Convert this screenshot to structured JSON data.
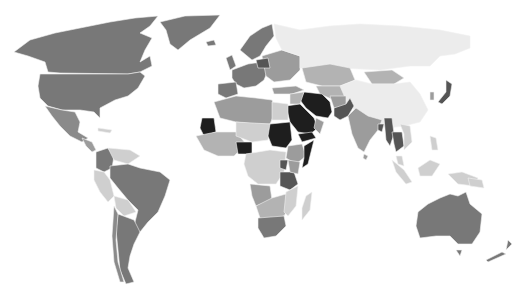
{
  "map": {
    "type": "choropleth",
    "projection": "world",
    "color_scale": {
      "lightest": "#ececec",
      "light": "#cfcfcf",
      "medium_light": "#b3b3b3",
      "medium": "#9c9c9c",
      "dark": "#787878",
      "darker": "#555555",
      "darkest": "#1e1e1e"
    },
    "regions": [
      {
        "name": "Canada",
        "shade": "dark"
      },
      {
        "name": "United States",
        "shade": "dark"
      },
      {
        "name": "Greenland",
        "shade": "dark"
      },
      {
        "name": "Mexico",
        "shade": "dark"
      },
      {
        "name": "Central America",
        "shade": "medium"
      },
      {
        "name": "Colombia",
        "shade": "dark"
      },
      {
        "name": "Venezuela",
        "shade": "light"
      },
      {
        "name": "Peru",
        "shade": "light"
      },
      {
        "name": "Brazil",
        "shade": "dark"
      },
      {
        "name": "Bolivia",
        "shade": "light"
      },
      {
        "name": "Argentina",
        "shade": "dark"
      },
      {
        "name": "Chile",
        "shade": "dark"
      },
      {
        "name": "Western Europe",
        "shade": "dark"
      },
      {
        "name": "Scandinavia",
        "shade": "dark"
      },
      {
        "name": "Eastern Europe",
        "shade": "medium"
      },
      {
        "name": "Russia",
        "shade": "lightest"
      },
      {
        "name": "Kazakhstan",
        "shade": "medium_light"
      },
      {
        "name": "Mongolia",
        "shade": "medium_light"
      },
      {
        "name": "China",
        "shade": "lightest"
      },
      {
        "name": "Japan",
        "shade": "darker"
      },
      {
        "name": "India",
        "shade": "medium"
      },
      {
        "name": "Pakistan",
        "shade": "darker"
      },
      {
        "name": "Iran",
        "shade": "darkest"
      },
      {
        "name": "Saudi Arabia",
        "shade": "darkest"
      },
      {
        "name": "Yemen",
        "shade": "darkest"
      },
      {
        "name": "Afghanistan",
        "shade": "medium"
      },
      {
        "name": "Myanmar",
        "shade": "darker"
      },
      {
        "name": "Thailand",
        "shade": "darker"
      },
      {
        "name": "Southeast Asia",
        "shade": "light"
      },
      {
        "name": "Indonesia",
        "shade": "light"
      },
      {
        "name": "Australia",
        "shade": "dark"
      },
      {
        "name": "New Zealand",
        "shade": "dark"
      },
      {
        "name": "North Africa",
        "shade": "medium"
      },
      {
        "name": "Egypt",
        "shade": "light"
      },
      {
        "name": "Mauritania",
        "shade": "darkest"
      },
      {
        "name": "Sudan",
        "shade": "darkest"
      },
      {
        "name": "Nigeria",
        "shade": "darkest"
      },
      {
        "name": "Sahel",
        "shade": "light"
      },
      {
        "name": "Central Africa",
        "shade": "light"
      },
      {
        "name": "Ethiopia",
        "shade": "medium"
      },
      {
        "name": "Somalia",
        "shade": "darkest"
      },
      {
        "name": "Uganda",
        "shade": "darker"
      },
      {
        "name": "Tanzania",
        "shade": "darker"
      },
      {
        "name": "Southern Africa",
        "shade": "medium"
      },
      {
        "name": "South Africa",
        "shade": "dark"
      },
      {
        "name": "Madagascar",
        "shade": "light"
      }
    ]
  }
}
